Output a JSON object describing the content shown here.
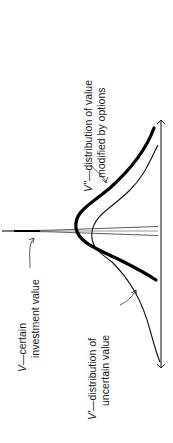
{
  "diagram": {
    "title": "",
    "orientation": "rotated-90-ccw",
    "colors": {
      "ink": "#111111",
      "background": "#ffffff"
    },
    "elements": {
      "axis": {
        "name": "value-axis",
        "arrows": "both-ends"
      },
      "spike": {
        "name": "certain-investment-value-spike"
      },
      "curve_uncertain": {
        "name": "distribution-of-uncertain-value",
        "stroke": "thin"
      },
      "curve_options": {
        "name": "distribution-modified-by-options",
        "stroke": "thick"
      }
    },
    "labels": {
      "v_double_prime": {
        "symbol": "V''",
        "dash": "—",
        "line1": "distribution of value",
        "line2": "modified by options"
      },
      "v": {
        "symbol": "V",
        "dash": "—",
        "line1": "certain",
        "line2": "investment value"
      },
      "v_prime": {
        "symbol": "V'",
        "dash": "—",
        "line1": "distribution of",
        "line2": "uncertain value"
      }
    }
  }
}
